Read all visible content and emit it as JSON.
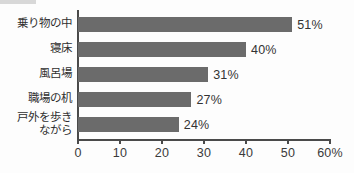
{
  "chart_data": {
    "type": "bar",
    "orientation": "horizontal",
    "title": "",
    "xlabel": "",
    "ylabel": "",
    "categories": [
      "乗り物の中",
      "寝床",
      "風呂場",
      "職場の机",
      "戸外を歩き\nながら"
    ],
    "values": [
      51,
      40,
      31,
      27,
      24
    ],
    "value_labels": [
      "51%",
      "40%",
      "31%",
      "27%",
      "24%"
    ],
    "xlim": [
      0,
      60
    ],
    "xticks": [
      0,
      10,
      20,
      30,
      40,
      50,
      60
    ],
    "xtick_labels": [
      "0",
      "10",
      "20",
      "30",
      "40",
      "50",
      "60%"
    ],
    "grid": false,
    "legend": null,
    "bar_color": "#6b6b6b",
    "axis_color": "#4a4a4a",
    "text_color": "#333333"
  }
}
